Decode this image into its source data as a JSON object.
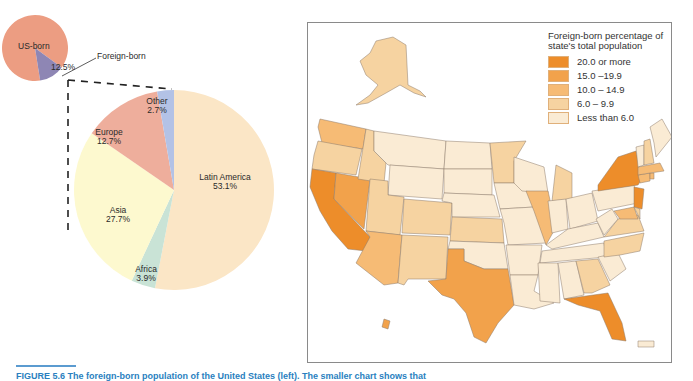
{
  "chart_data": [
    {
      "type": "pie",
      "title": "",
      "categories": [
        "Foreign-born",
        "US-born"
      ],
      "values": [
        12.5,
        87.5
      ],
      "labels": {
        "us_born": "US-born",
        "foreign_born": "Foreign-born",
        "foreign_pct": "12.5%"
      },
      "colors": {
        "US-born": "#ec9d82",
        "Foreign-born": "#8e86b4"
      }
    },
    {
      "type": "pie",
      "title": "Foreign-born by region of birth",
      "categories": [
        "Latin America",
        "Africa",
        "Asia",
        "Europe",
        "Other"
      ],
      "values": [
        53.1,
        3.9,
        27.7,
        12.7,
        2.7
      ],
      "value_labels": [
        "53.1%",
        "3.9%",
        "27.7%",
        "12.7%",
        "2.7%"
      ],
      "colors": [
        "#fbe6c6",
        "#c9e3d6",
        "#fdf9cf",
        "#eeae9c",
        "#b3c2e6"
      ]
    },
    {
      "type": "heatmap",
      "kind": "choropleth-map",
      "title": "Foreign-born percentage of state's total population",
      "legend": [
        {
          "label": "20.0 or more",
          "color": "#ed8d2a"
        },
        {
          "label": "15.0 –19.9",
          "color": "#f2a24b"
        },
        {
          "label": "10.0 – 14.9",
          "color": "#f6bb75"
        },
        {
          "label": "6.0 – 9.9",
          "color": "#f6d3a1"
        },
        {
          "label": "Less than 6.0",
          "color": "#faebd4"
        }
      ],
      "states": {
        "20.0 or more": [
          "California",
          "New York",
          "New Jersey",
          "Florida"
        ],
        "15.0 –19.9": [
          "Texas",
          "Nevada",
          "Hawaii"
        ],
        "10.0 – 14.9": [
          "Arizona",
          "Illinois",
          "Washington",
          "Massachusetts",
          "Maryland",
          "Connecticut",
          "Rhode Island"
        ],
        "6.0 – 9.9": [
          "Oregon",
          "Idaho",
          "Utah",
          "Colorado",
          "New Mexico",
          "Kansas",
          "Minnesota",
          "Michigan",
          "Virginia",
          "Georgia",
          "North Carolina",
          "Alaska",
          "Delaware",
          "New Hampshire"
        ],
        "Less than 6.0": [
          "Montana",
          "Wyoming",
          "North Dakota",
          "South Dakota",
          "Nebraska",
          "Oklahoma",
          "Iowa",
          "Missouri",
          "Arkansas",
          "Louisiana",
          "Wisconsin",
          "Indiana",
          "Ohio",
          "Kentucky",
          "Tennessee",
          "Mississippi",
          "Alabama",
          "South Carolina",
          "West Virginia",
          "Pennsylvania",
          "Vermont",
          "Maine",
          "Puerto Rico"
        ]
      }
    }
  ],
  "caption": "FIGURE 5.6 The foreign-born population of the United States (left). The smaller chart shows that"
}
